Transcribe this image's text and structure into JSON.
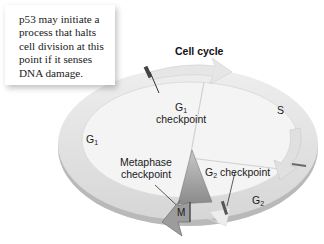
{
  "diagram": {
    "title": "Cell cycle",
    "callout": {
      "lines": [
        "p53 may initiate a",
        "process that halts",
        "cell division at this",
        "point if it senses",
        "DNA damage."
      ]
    },
    "phases": {
      "g1": {
        "base": "G",
        "sub": "1"
      },
      "s": {
        "base": "S"
      },
      "g2": {
        "base": "G",
        "sub": "2"
      },
      "m": {
        "base": "M"
      }
    },
    "checkpoints": {
      "g1": {
        "base": "G",
        "sub": "1",
        "word": "checkpoint"
      },
      "g2": {
        "base": "G",
        "sub": "2",
        "word": "checkpoint"
      },
      "metaphase": {
        "line1": "Metaphase",
        "line2": "checkpoint"
      }
    },
    "colors": {
      "ring": "#e4e4e4",
      "ring_edge": "#a8a8a8",
      "inner": "#f3f3f3",
      "arrow": "#ececec",
      "marker": "#555555",
      "m_phase": "#9a9a9a"
    }
  }
}
